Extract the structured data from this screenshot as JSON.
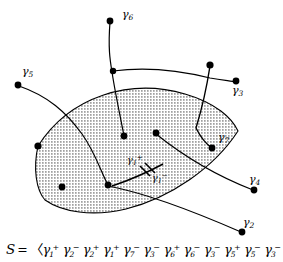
{
  "figure": {
    "type": "topological-diagram",
    "background_color": "#ffffff",
    "stroke_color": "#000000",
    "shading": "dot-stipple",
    "curve_labels": [
      {
        "id": "g6",
        "text": "γ",
        "sub": "6",
        "sup": "",
        "x": 122,
        "y": 14
      },
      {
        "id": "g5",
        "text": "γ",
        "sub": "5",
        "sup": "",
        "x": 22,
        "y": 71
      },
      {
        "id": "g3",
        "text": "γ",
        "sub": "3",
        "sup": "",
        "x": 232,
        "y": 90
      },
      {
        "id": "g7",
        "text": "γ",
        "sub": "7",
        "sup": "",
        "x": 218,
        "y": 137
      },
      {
        "id": "g4",
        "text": "γ",
        "sub": "4",
        "sup": "",
        "x": 249,
        "y": 179
      },
      {
        "id": "g2",
        "text": "γ",
        "sub": "2",
        "sup": "",
        "x": 243,
        "y": 222
      },
      {
        "id": "g1p",
        "text": "γ",
        "sub": "1",
        "sup": "+",
        "x": 127,
        "y": 160
      },
      {
        "id": "g1m",
        "text": "γ",
        "sub": "1",
        "sup": "−",
        "x": 152,
        "y": 178
      }
    ],
    "endpoint_dots": [
      {
        "id": "dot-g6-top",
        "x": 110,
        "y": 21,
        "r": 3.2
      },
      {
        "id": "dot-g6-mid",
        "x": 113,
        "y": 71,
        "r": 3.2
      },
      {
        "id": "dot-g5-left",
        "x": 18,
        "y": 85,
        "r": 3.2
      },
      {
        "id": "dot-g3-top",
        "x": 210,
        "y": 65,
        "r": 3.2
      },
      {
        "id": "dot-g3-right",
        "x": 236,
        "y": 81,
        "r": 3.2
      },
      {
        "id": "dot-g7-end",
        "x": 212,
        "y": 148,
        "r": 3.2
      },
      {
        "id": "dot-region-left",
        "x": 38,
        "y": 146,
        "r": 3.2
      },
      {
        "id": "dot-inner-a",
        "x": 124,
        "y": 136,
        "r": 3.2
      },
      {
        "id": "dot-inner-b",
        "x": 156,
        "y": 133,
        "r": 3.2
      },
      {
        "id": "dot-inner-c",
        "x": 108,
        "y": 185,
        "r": 3.2
      },
      {
        "id": "dot-inner-d",
        "x": 62,
        "y": 187,
        "r": 3.2
      },
      {
        "id": "dot-g4-end",
        "x": 254,
        "y": 190,
        "r": 3.2
      },
      {
        "id": "dot-g2-end",
        "x": 242,
        "y": 232,
        "r": 3.2
      }
    ]
  },
  "equation": {
    "lhs": "S",
    "relation": "=",
    "open_bracket": "〈",
    "close_bracket": "〉",
    "gamma": "γ",
    "terms": [
      {
        "sub": "1",
        "sup": "+"
      },
      {
        "sub": "2",
        "sup": "−"
      },
      {
        "sub": "2",
        "sup": "+"
      },
      {
        "sub": "1",
        "sup": "+"
      },
      {
        "sub": "7",
        "sup": "−"
      },
      {
        "sub": "3",
        "sup": "−"
      },
      {
        "sub": "6",
        "sup": "+"
      },
      {
        "sub": "6",
        "sup": "−"
      },
      {
        "sub": "3",
        "sup": "−"
      },
      {
        "sub": "5",
        "sup": "+"
      },
      {
        "sub": "5",
        "sup": "−"
      },
      {
        "sub": "3",
        "sup": "−"
      },
      {
        "sub": "4",
        "sup": "+"
      },
      {
        "sub": "2",
        "sup": "−"
      },
      {
        "sub": "1",
        "sup": "−"
      }
    ],
    "full_text": "S = ⟨γ1+γ2-γ2+γ1+γ7-γ3-γ6+γ6-γ3-γ5+γ5-γ3-γ4+γ2-γ1-⟩"
  }
}
